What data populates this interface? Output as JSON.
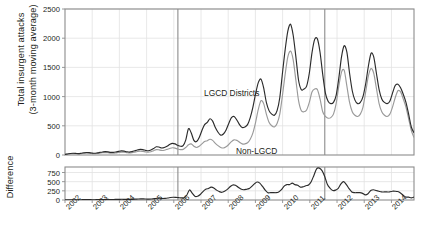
{
  "chart_data": {
    "type": "line",
    "title": "",
    "panels": [
      {
        "id": "main",
        "ylabel": "Total insurgent attacks\n(3-month moving average)",
        "ylabel_line1": "Total insurgent attacks",
        "ylabel_line2": "(3-month moving average)",
        "ylim": [
          0,
          2500
        ],
        "yticks": [
          0,
          500,
          1000,
          1500,
          2000,
          2500
        ],
        "grid": true,
        "legend_position": "inline-annotation",
        "series": [
          {
            "name": "LGCD Districts",
            "color": "#2b2b2b",
            "values": [
              10,
              18,
              26,
              30,
              28,
              24,
              30,
              38,
              42,
              40,
              34,
              30,
              36,
              44,
              52,
              58,
              54,
              46,
              44,
              52,
              62,
              70,
              66,
              56,
              50,
              58,
              72,
              86,
              96,
              92,
              80,
              72,
              84,
              110,
              140,
              136,
              120,
              128,
              150,
              180,
              200,
              190,
              166,
              150,
              160,
              260,
              450,
              380,
              250,
              230,
              300,
              420,
              520,
              560,
              620,
              580,
              470,
              390,
              340,
              360,
              430,
              540,
              640,
              660,
              600,
              520,
              470,
              480,
              520,
              640,
              820,
              1050,
              1240,
              1300,
              1150,
              900,
              760,
              700,
              680,
              760,
              980,
              1400,
              1800,
              2120,
              2240,
              2050,
              1680,
              1280,
              1120,
              1130,
              1180,
              1400,
              1750,
              1980,
              1990,
              1760,
              1380,
              1060,
              920,
              880,
              900,
              1020,
              1320,
              1680,
              1870,
              1760,
              1400,
              1100,
              940,
              880,
              900,
              1000,
              1220,
              1520,
              1740,
              1680,
              1400,
              1120,
              960,
              900,
              880,
              920,
              1060,
              1190,
              1210,
              1150,
              1040,
              900,
              700,
              480,
              380
            ]
          },
          {
            "name": "Non-LGCD",
            "color": "#9a9a9a",
            "values": [
              8,
              14,
              20,
              24,
              22,
              18,
              22,
              28,
              32,
              30,
              26,
              22,
              26,
              32,
              38,
              42,
              38,
              32,
              30,
              36,
              44,
              50,
              48,
              40,
              34,
              40,
              50,
              60,
              66,
              62,
              54,
              48,
              56,
              74,
              92,
              88,
              78,
              82,
              96,
              112,
              124,
              118,
              102,
              92,
              96,
              130,
              175,
              190,
              150,
              128,
              150,
              190,
              230,
              245,
              270,
              250,
              200,
              160,
              130,
              120,
              140,
              180,
              230,
              260,
              250,
              220,
              190,
              190,
              210,
              270,
              380,
              560,
              780,
              930,
              880,
              700,
              560,
              500,
              480,
              540,
              700,
              1020,
              1380,
              1680,
              1780,
              1630,
              1280,
              930,
              760,
              740,
              770,
              900,
              1080,
              1130,
              1120,
              960,
              740,
              660,
              630,
              640,
              700,
              880,
              1180,
              1420,
              1450,
              1180,
              900,
              740,
              680,
              660,
              700,
              820,
              1080,
              1350,
              1480,
              1400,
              1140,
              880,
              740,
              680,
              660,
              700,
              820,
              980,
              1100,
              1080,
              960,
              820,
              620,
              420,
              300
            ]
          }
        ],
        "reference_lines": [
          {
            "label": "2006",
            "x_year": 2006.15
          },
          {
            "label": "2011",
            "x_year": 2011.55
          }
        ],
        "annotations": [
          {
            "text": "LGCD Districts",
            "x_px": 204,
            "y_px": 88
          },
          {
            "text": "Non-LGCD",
            "x_px": 236,
            "y_px": 146
          }
        ]
      },
      {
        "id": "difference",
        "ylabel": "Difference",
        "ylim": [
          0,
          900
        ],
        "yticks": [
          0,
          250,
          500,
          750
        ],
        "grid": true,
        "series": [
          {
            "name": "Difference",
            "color": "#2b2b2b",
            "values": [
              2,
              4,
              6,
              6,
              6,
              6,
              8,
              10,
              10,
              10,
              8,
              8,
              10,
              12,
              14,
              16,
              16,
              14,
              14,
              16,
              18,
              20,
              18,
              16,
              16,
              18,
              22,
              26,
              30,
              30,
              26,
              24,
              28,
              36,
              48,
              48,
              42,
              46,
              54,
              68,
              76,
              72,
              64,
              58,
              64,
              130,
              275,
              190,
              100,
              102,
              150,
              230,
              290,
              315,
              350,
              330,
              270,
              230,
              210,
              240,
              290,
              360,
              410,
              400,
              350,
              300,
              280,
              290,
              310,
              370,
              440,
              490,
              460,
              370,
              270,
              200,
              200,
              200,
              200,
              220,
              280,
              380,
              420,
              420,
              460,
              420,
              400,
              350,
              360,
              390,
              410,
              500,
              670,
              850,
              870,
              800,
              640,
              420,
              320,
              260,
              270,
              320,
              440,
              500,
              420,
              310,
              220,
              200,
              200,
              200,
              180,
              140,
              170,
              260,
              280,
              260,
              240,
              220,
              220,
              220,
              220,
              240,
              240,
              230,
              190,
              130,
              80,
              80,
              60,
              80
            ]
          }
        ],
        "reference_lines": [
          {
            "label": "2006",
            "x_year": 2006.15
          },
          {
            "label": "2011",
            "x_year": 2011.55
          }
        ]
      }
    ],
    "x": {
      "label": "",
      "xlim": [
        2002.0,
        2014.83
      ],
      "ticks": [
        "2002",
        "2003",
        "2004",
        "2005",
        "2006",
        "2007",
        "2008",
        "2009",
        "2010",
        "2011",
        "2012",
        "2013",
        "2014"
      ],
      "tick_years": [
        2002,
        2003,
        2004,
        2005,
        2006,
        2007,
        2008,
        2009,
        2010,
        2011,
        2012,
        2013,
        2014
      ],
      "rotation_deg": -45
    },
    "colors": {
      "series_dark": "#2b2b2b",
      "series_gray": "#9a9a9a",
      "frame": "#8c8c8c",
      "grid": "#e2e2e2",
      "reference_line": "#8c8c8c",
      "text": "#231f20",
      "background": "#ffffff"
    }
  }
}
